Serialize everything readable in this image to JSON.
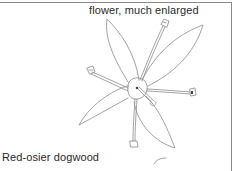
{
  "illustration": {
    "caption": "flower, much enlarged",
    "label": "Red-osier dogwood",
    "subject": "flower-line-drawing",
    "line_color": "#8c8c8c",
    "border_color": "#8a8a8a"
  }
}
